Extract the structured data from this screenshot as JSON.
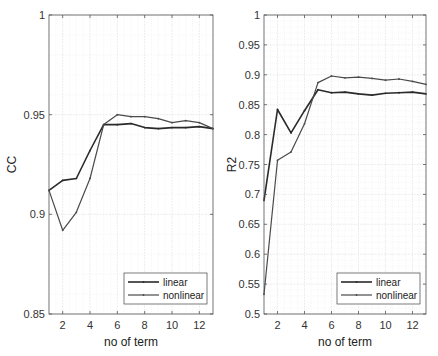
{
  "chart_data": [
    {
      "type": "line",
      "title": "",
      "xlabel": "no of term",
      "ylabel": "CC",
      "xlim": [
        1,
        13
      ],
      "ylim": [
        0.85,
        1
      ],
      "xticks": [
        2,
        4,
        6,
        8,
        10,
        12
      ],
      "xtick_labels": [
        "2",
        "4",
        "6",
        "8",
        "10",
        "12"
      ],
      "yticks": [
        0.85,
        0.9,
        0.95,
        1
      ],
      "ytick_labels": [
        "0.85",
        "0.9",
        "0.95",
        "1"
      ],
      "grid": true,
      "legend_position": "lower right",
      "x": [
        1,
        2,
        3,
        4,
        5,
        6,
        7,
        8,
        9,
        10,
        11,
        12,
        13
      ],
      "series": [
        {
          "name": "linear",
          "values": [
            0.912,
            0.917,
            0.918,
            0.932,
            0.945,
            0.945,
            0.9455,
            0.9435,
            0.943,
            0.9435,
            0.9435,
            0.944,
            0.943
          ]
        },
        {
          "name": "nonlinear",
          "values": [
            0.912,
            0.892,
            0.901,
            0.918,
            0.945,
            0.95,
            0.949,
            0.949,
            0.948,
            0.946,
            0.947,
            0.946,
            0.943
          ]
        }
      ]
    },
    {
      "type": "line",
      "title": "",
      "xlabel": "no of term",
      "ylabel": "R2",
      "xlim": [
        1,
        13
      ],
      "ylim": [
        0.5,
        1
      ],
      "xticks": [
        2,
        4,
        6,
        8,
        10,
        12
      ],
      "xtick_labels": [
        "2",
        "4",
        "6",
        "8",
        "10",
        "12"
      ],
      "yticks": [
        0.5,
        0.55,
        0.6,
        0.65,
        0.7,
        0.75,
        0.8,
        0.85,
        0.9,
        0.95,
        1
      ],
      "ytick_labels": [
        "0.5",
        "0.55",
        "0.6",
        "0.65",
        "0.7",
        "0.75",
        "0.8",
        "0.85",
        "0.9",
        "0.95",
        "1"
      ],
      "grid": true,
      "legend_position": "lower right",
      "x": [
        1,
        2,
        3,
        4,
        5,
        6,
        7,
        8,
        9,
        10,
        11,
        12,
        13
      ],
      "series": [
        {
          "name": "linear",
          "values": [
            0.69,
            0.842,
            0.803,
            0.84,
            0.875,
            0.87,
            0.871,
            0.868,
            0.866,
            0.869,
            0.87,
            0.871,
            0.868
          ]
        },
        {
          "name": "nonlinear",
          "values": [
            0.533,
            0.757,
            0.771,
            0.818,
            0.887,
            0.898,
            0.895,
            0.896,
            0.894,
            0.891,
            0.893,
            0.889,
            0.884
          ]
        }
      ]
    }
  ],
  "style": {
    "linear_color": "#2a2a2a",
    "nonlinear_color": "#4a4a4a",
    "axis_color": "#555555",
    "grid_color": "#e6e6e6"
  }
}
